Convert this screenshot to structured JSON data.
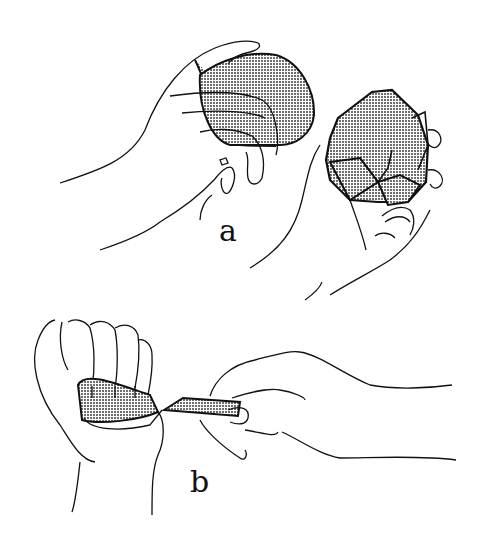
{
  "figure": {
    "panels": [
      {
        "id": "a",
        "label": "a",
        "description": "Two hands: left hand gripping a rounded stone core; right hand holding a faceted flaked stone with detached flakes"
      },
      {
        "id": "b",
        "label": "b",
        "description": "Left hand clenched holding a shaded material strip in palm; right hand pulling a blade-like flake between thumb and fingers"
      }
    ],
    "colors": {
      "line": "#111111",
      "shade": "#9a9a9a",
      "background": "#ffffff"
    }
  }
}
